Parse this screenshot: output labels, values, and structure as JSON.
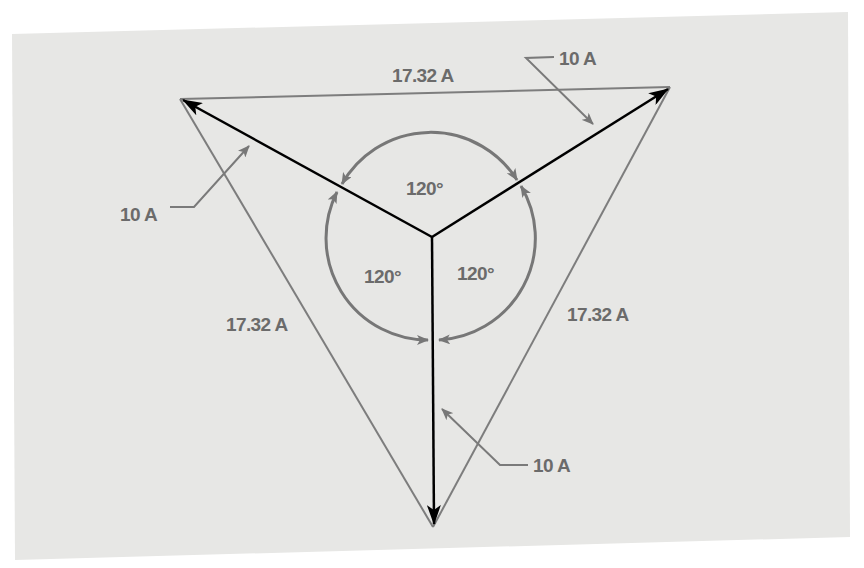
{
  "diagram": {
    "colors": {
      "background_page": "#ffffff",
      "panel": "#e8e8e6",
      "phasor": "#000000",
      "triangle": "#7a7a7a",
      "labels": "#6b6b6b",
      "angle_arcs": "#777777"
    },
    "center": {
      "x": 432,
      "y": 237
    },
    "phasors": [
      {
        "name": "phasor-upper-left",
        "magnitude_label": "10 A",
        "tip": {
          "x": 181,
          "y": 99
        }
      },
      {
        "name": "phasor-upper-right",
        "magnitude_label": "10 A",
        "tip": {
          "x": 670,
          "y": 87
        }
      },
      {
        "name": "phasor-down",
        "magnitude_label": "10 A",
        "tip": {
          "x": 434,
          "y": 525
        }
      }
    ],
    "triangle_sides": [
      {
        "name": "side-top",
        "label": "17.32 A"
      },
      {
        "name": "side-left",
        "label": "17.32 A"
      },
      {
        "name": "side-right",
        "label": "17.32 A"
      }
    ],
    "angles": [
      {
        "name": "angle-top",
        "label": "120°"
      },
      {
        "name": "angle-left",
        "label": "120°"
      },
      {
        "name": "angle-right",
        "label": "120°"
      }
    ],
    "callouts": [
      {
        "name": "callout-left",
        "label": "10 A"
      },
      {
        "name": "callout-top-right",
        "label": "10 A"
      },
      {
        "name": "callout-bottom",
        "label": "10 A"
      }
    ]
  }
}
